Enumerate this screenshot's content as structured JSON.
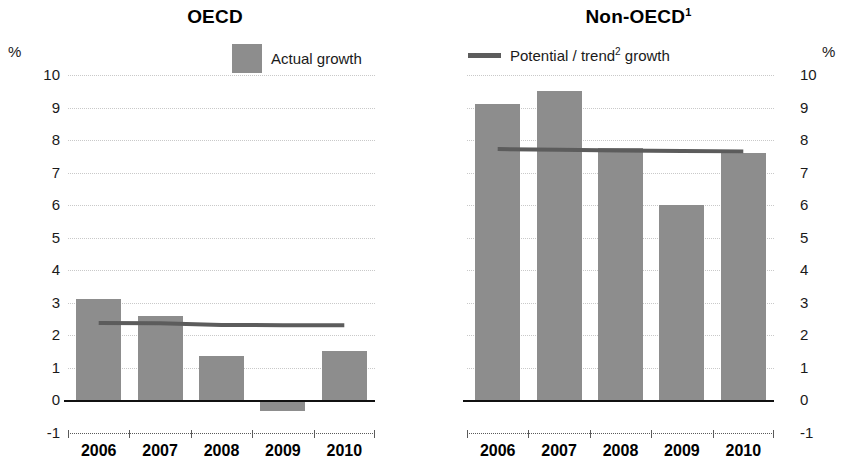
{
  "panels": {
    "left": {
      "title": "OECD",
      "title_sup": "",
      "unit": "%"
    },
    "right": {
      "title": "Non-OECD",
      "title_sup": "1",
      "unit": "%"
    }
  },
  "legend": {
    "actual": {
      "label": "Actual growth",
      "swatch_color": "#8d8d8d",
      "marker": "bar-swatch"
    },
    "potential": {
      "label_before": "Potential / trend",
      "label_sup": "2",
      "label_after": " growth",
      "line_color": "#5c5c5c",
      "marker": "line-swatch"
    }
  },
  "axis": {
    "y_ticks": [
      "10",
      "9",
      "8",
      "7",
      "6",
      "5",
      "4",
      "3",
      "2",
      "1",
      "0",
      "-1"
    ],
    "y_min": -1,
    "y_max": 10,
    "x_categories": [
      "2006",
      "2007",
      "2008",
      "2009",
      "2010"
    ]
  },
  "colors": {
    "bar": "#8d8d8d",
    "trend": "#5c5c5c",
    "gridline": "#c9c9c9",
    "zeroline": "#111111",
    "text": "#1a1a1a"
  },
  "chart_data": [
    {
      "type": "bar",
      "title": "OECD",
      "xlabel": "",
      "ylabel": "%",
      "ylim": [
        -1,
        10
      ],
      "grid": true,
      "legend_position": "top",
      "categories": [
        "2006",
        "2007",
        "2008",
        "2009",
        "2010"
      ],
      "series": [
        {
          "name": "Actual growth",
          "type": "bar",
          "values": [
            3.1,
            2.6,
            1.35,
            -0.35,
            1.5
          ]
        },
        {
          "name": "Potential / trend growth",
          "type": "line",
          "values": [
            2.37,
            2.36,
            2.31,
            2.3,
            2.3
          ]
        }
      ]
    },
    {
      "type": "bar",
      "title": "Non-OECD",
      "xlabel": "",
      "ylabel": "%",
      "ylim": [
        -1,
        10
      ],
      "grid": true,
      "legend_position": "top",
      "categories": [
        "2006",
        "2007",
        "2008",
        "2009",
        "2010"
      ],
      "series": [
        {
          "name": "Actual growth",
          "type": "bar",
          "values": [
            9.1,
            9.5,
            7.75,
            6.0,
            7.6
          ]
        },
        {
          "name": "Potential / trend growth",
          "type": "line",
          "values": [
            7.72,
            7.7,
            7.68,
            7.66,
            7.65
          ]
        }
      ]
    }
  ]
}
